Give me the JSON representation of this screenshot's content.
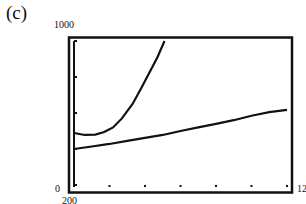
{
  "panel_label": "(c)",
  "axes": {
    "ymax_label": "1000",
    "ymin_label": "200",
    "xmin_label": "0",
    "xmax_label": "12"
  },
  "chart_data": {
    "type": "line",
    "title": "",
    "xlabel": "",
    "ylabel": "",
    "xlim": [
      0,
      12
    ],
    "ylim": [
      200,
      1000
    ],
    "x_ticks": [
      0,
      2,
      4,
      6,
      8,
      10,
      12
    ],
    "y_ticks": [
      200,
      400,
      600,
      800,
      1000
    ],
    "grid": false,
    "series": [
      {
        "name": "upper curve",
        "x": [
          0,
          0.6,
          1.2,
          1.7,
          2.2,
          2.7,
          3.3,
          3.8,
          4.2,
          4.7,
          5.1
        ],
        "values": [
          489,
          478,
          480,
          494,
          520,
          570,
          650,
          740,
          815,
          910,
          1000
        ]
      },
      {
        "name": "lower curve",
        "x": [
          0,
          1,
          2,
          3,
          4,
          5,
          6,
          7,
          8,
          9,
          10,
          11,
          12
        ],
        "values": [
          400,
          414,
          428,
          445,
          462,
          478,
          500,
          520,
          540,
          560,
          585,
          605,
          617
        ]
      }
    ]
  }
}
